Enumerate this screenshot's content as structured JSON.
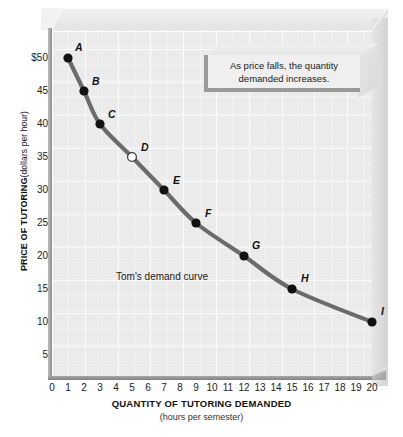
{
  "chart_data": {
    "type": "line",
    "title": "",
    "xlabel": "QUANTITY OF TUTORING DEMANDED",
    "xsublabel": "(hours per semester)",
    "ylabel": "PRICE OF TUTORING",
    "ysublabel": "(dollars per hour)",
    "xlim": [
      0,
      20
    ],
    "ylim": [
      0,
      52
    ],
    "grid": true,
    "legend": "none",
    "x": [
      1,
      2,
      3,
      5,
      7,
      9,
      12,
      15,
      20
    ],
    "values": [
      50,
      45,
      40,
      35,
      30,
      25,
      20,
      15,
      10
    ],
    "point_labels": [
      "A",
      "B",
      "C",
      "D",
      "E",
      "F",
      "G",
      "H",
      "I"
    ],
    "series": [
      {
        "name": "Tom's demand curve",
        "points": [
          {
            "label": "A",
            "x": 1,
            "y": 50,
            "marker": "filled"
          },
          {
            "label": "B",
            "x": 2,
            "y": 45,
            "marker": "filled"
          },
          {
            "label": "C",
            "x": 3,
            "y": 40,
            "marker": "filled"
          },
          {
            "label": "D",
            "x": 5,
            "y": 35,
            "marker": "open"
          },
          {
            "label": "E",
            "x": 7,
            "y": 30,
            "marker": "filled"
          },
          {
            "label": "F",
            "x": 9,
            "y": 25,
            "marker": "filled"
          },
          {
            "label": "G",
            "x": 12,
            "y": 20,
            "marker": "filled"
          },
          {
            "label": "H",
            "x": 15,
            "y": 15,
            "marker": "filled"
          },
          {
            "label": "I",
            "x": 20,
            "y": 10,
            "marker": "filled"
          }
        ]
      }
    ],
    "xticks": [
      "0",
      "1",
      "2",
      "3",
      "4",
      "5",
      "6",
      "7",
      "8",
      "9",
      "10",
      "11",
      "12",
      "13",
      "14",
      "15",
      "16",
      "17",
      "18",
      "19",
      "20"
    ],
    "yticks": [
      "$50",
      "45",
      "40",
      "35",
      "30",
      "25",
      "20",
      "15",
      "10",
      "5"
    ],
    "ytick_values": [
      50,
      45,
      40,
      35,
      30,
      25,
      20,
      15,
      10,
      5
    ],
    "annotations": [
      {
        "name": "curve-note",
        "text": "Tom's demand curve"
      },
      {
        "name": "callout",
        "text": "As price falls, the quantity demanded increases."
      }
    ],
    "colors": {
      "curve": "#6b6b6b",
      "marker_fill": "#111111",
      "marker_open_fill": "#ffffff",
      "plot_background": "#ebebeb",
      "panel_3d": "#e4e4e4",
      "axis": "#8e8e8e",
      "text": "#1a1a1a"
    }
  },
  "callout": {
    "line1": "As price falls, the quantity",
    "line2": "demanded increases."
  }
}
